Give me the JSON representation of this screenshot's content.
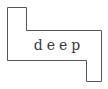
{
  "logo": {
    "word": "deep",
    "stroke_color": "#555555",
    "text_color": "#3a3a3a",
    "background": "#ffffff"
  }
}
